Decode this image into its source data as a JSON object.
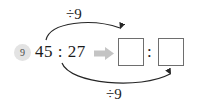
{
  "exercise": {
    "number": "9",
    "prompt": "45 : 27",
    "implies_icon": "right-arrow-icon"
  },
  "operations": {
    "top": {
      "label": "÷9",
      "arrow_icon": "curved-arrow-down-right-icon",
      "target": "left-answer-box"
    },
    "bottom": {
      "label": "÷9",
      "arrow_icon": "curved-arrow-up-right-icon",
      "target": "right-answer-box"
    }
  },
  "answer": {
    "left_value": "",
    "right_value": "",
    "separator": ":",
    "placeholder": ""
  },
  "colors": {
    "ink": "#1b1b1b",
    "badge_bg": "#e3e3e3",
    "badge_text": "#4a4a4a",
    "box_border": "#6e6e6e",
    "implies_arrow": "#c4c4c4",
    "curve": "#262626"
  }
}
